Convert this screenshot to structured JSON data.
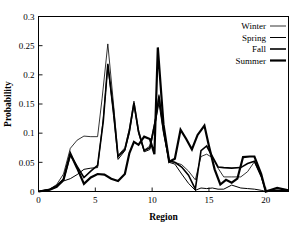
{
  "chart_data": {
    "type": "line",
    "title": "",
    "xlabel": "Region",
    "ylabel": "Probability",
    "xlim": [
      0,
      22
    ],
    "ylim": [
      0,
      0.3
    ],
    "grid": false,
    "legend_position": "top-right",
    "xticks": [
      "0",
      "5",
      "10",
      "15",
      "20"
    ],
    "xtick_values": [
      0,
      5,
      10,
      15,
      20
    ],
    "yticks": [
      "0",
      "0.05",
      "0.1",
      "0.15",
      "0.2",
      "0.25",
      "0.3"
    ],
    "ytick_values": [
      0,
      0.05,
      0.1,
      0.15,
      0.2,
      0.25,
      0.3
    ],
    "x": [
      0,
      1,
      2,
      3,
      4,
      5,
      6,
      7,
      8,
      9,
      10,
      11,
      12,
      13,
      14,
      15,
      16,
      17,
      18,
      19,
      20,
      21,
      22
    ],
    "series": [
      {
        "name": "Winter",
        "line_width": 0.8,
        "color": "#000000",
        "values": [
          0.0,
          0.005,
          0.021,
          0.074,
          0.095,
          0.094,
          0.253,
          0.112,
          0.155,
          0.088,
          0.166,
          0.081,
          0.052,
          0.049,
          0.064,
          0.06,
          0.025,
          0.025,
          0.025,
          0.051,
          0.0,
          0.0,
          0.0
        ]
      },
      {
        "name": "Spring",
        "line_width": 1.0,
        "color": "#000000",
        "values": [
          0.0,
          0.003,
          0.012,
          0.022,
          0.038,
          0.041,
          0.216,
          0.083,
          0.148,
          0.076,
          0.152,
          0.069,
          0.05,
          0.047,
          0.009,
          0.006,
          0.005,
          0.011,
          0.006,
          0.004,
          0.0,
          0.0,
          0.0
        ]
      },
      {
        "name": "Fall",
        "line_width": 1.6,
        "color": "#000000",
        "values": [
          0.0,
          0.004,
          0.018,
          0.063,
          0.024,
          0.045,
          0.219,
          0.071,
          0.152,
          0.081,
          0.163,
          0.073,
          0.056,
          0.053,
          0.07,
          0.078,
          0.041,
          0.041,
          0.041,
          0.052,
          0.001,
          0.002,
          0.001
        ]
      },
      {
        "name": "Summer",
        "line_width": 2.2,
        "color": "#000000",
        "values": [
          0.0,
          0.004,
          0.01,
          0.065,
          0.013,
          0.03,
          0.029,
          0.018,
          0.085,
          0.094,
          0.064,
          0.247,
          0.051,
          0.106,
          0.072,
          0.113,
          0.038,
          0.028,
          0.059,
          0.06,
          0.0,
          0.006,
          0.002
        ]
      }
    ],
    "series_detail_points": {
      "Winter": [
        [
          0,
          0.0
        ],
        [
          1,
          0.004
        ],
        [
          1.6,
          0.012
        ],
        [
          2.2,
          0.03
        ],
        [
          2.8,
          0.074
        ],
        [
          3.4,
          0.088
        ],
        [
          4.0,
          0.095
        ],
        [
          4.6,
          0.094
        ],
        [
          5.2,
          0.094
        ],
        [
          5.6,
          0.16
        ],
        [
          6.1,
          0.253
        ],
        [
          6.6,
          0.15
        ],
        [
          7.0,
          0.062
        ],
        [
          7.6,
          0.075
        ],
        [
          8.0,
          0.108
        ],
        [
          8.4,
          0.155
        ],
        [
          8.8,
          0.106
        ],
        [
          9.3,
          0.071
        ],
        [
          9.8,
          0.078
        ],
        [
          10.3,
          0.126
        ],
        [
          10.6,
          0.166
        ],
        [
          11.0,
          0.11
        ],
        [
          11.5,
          0.052
        ],
        [
          12.0,
          0.05
        ],
        [
          12.6,
          0.046
        ],
        [
          13.2,
          0.035
        ],
        [
          13.8,
          0.02
        ],
        [
          14.3,
          0.06
        ],
        [
          14.8,
          0.064
        ],
        [
          15.3,
          0.058
        ],
        [
          15.8,
          0.04
        ],
        [
          16.3,
          0.025
        ],
        [
          17.0,
          0.025
        ],
        [
          17.8,
          0.025
        ],
        [
          18.4,
          0.034
        ],
        [
          19.0,
          0.051
        ],
        [
          19.6,
          0.026
        ],
        [
          20.0,
          0.0
        ],
        [
          21,
          0.0
        ],
        [
          22,
          0.0
        ]
      ],
      "Spring": [
        [
          0,
          0.0
        ],
        [
          1,
          0.003
        ],
        [
          1.6,
          0.008
        ],
        [
          2.2,
          0.018
        ],
        [
          2.8,
          0.022
        ],
        [
          3.4,
          0.029
        ],
        [
          4.0,
          0.038
        ],
        [
          4.6,
          0.04
        ],
        [
          5.2,
          0.041
        ],
        [
          5.7,
          0.125
        ],
        [
          6.1,
          0.216
        ],
        [
          6.6,
          0.13
        ],
        [
          7.0,
          0.055
        ],
        [
          7.6,
          0.07
        ],
        [
          8.0,
          0.1
        ],
        [
          8.4,
          0.148
        ],
        [
          8.8,
          0.1
        ],
        [
          9.3,
          0.068
        ],
        [
          9.8,
          0.072
        ],
        [
          10.3,
          0.12
        ],
        [
          10.6,
          0.152
        ],
        [
          11.0,
          0.1
        ],
        [
          11.5,
          0.05
        ],
        [
          12.0,
          0.047
        ],
        [
          12.6,
          0.03
        ],
        [
          13.2,
          0.014
        ],
        [
          13.8,
          0.002
        ],
        [
          14.3,
          0.006
        ],
        [
          14.8,
          0.005
        ],
        [
          15.3,
          0.006
        ],
        [
          15.8,
          0.004
        ],
        [
          16.3,
          0.004
        ],
        [
          17.0,
          0.011
        ],
        [
          17.8,
          0.006
        ],
        [
          18.4,
          0.005
        ],
        [
          19.0,
          0.004
        ],
        [
          19.6,
          0.002
        ],
        [
          20.0,
          0.0
        ],
        [
          21,
          0.0
        ],
        [
          22,
          0.0
        ]
      ],
      "Fall": [
        [
          0,
          0.0
        ],
        [
          1,
          0.004
        ],
        [
          1.6,
          0.01
        ],
        [
          2.2,
          0.021
        ],
        [
          2.8,
          0.063
        ],
        [
          3.4,
          0.043
        ],
        [
          4.0,
          0.024
        ],
        [
          4.6,
          0.035
        ],
        [
          5.2,
          0.045
        ],
        [
          5.7,
          0.12
        ],
        [
          6.1,
          0.219
        ],
        [
          6.6,
          0.14
        ],
        [
          7.0,
          0.06
        ],
        [
          7.6,
          0.072
        ],
        [
          8.0,
          0.105
        ],
        [
          8.4,
          0.152
        ],
        [
          8.8,
          0.103
        ],
        [
          9.3,
          0.07
        ],
        [
          9.8,
          0.075
        ],
        [
          10.3,
          0.123
        ],
        [
          10.6,
          0.163
        ],
        [
          11.0,
          0.105
        ],
        [
          11.5,
          0.052
        ],
        [
          12.0,
          0.05
        ],
        [
          12.6,
          0.042
        ],
        [
          13.2,
          0.028
        ],
        [
          13.8,
          0.004
        ],
        [
          14.3,
          0.07
        ],
        [
          14.8,
          0.078
        ],
        [
          15.3,
          0.06
        ],
        [
          15.8,
          0.042
        ],
        [
          16.3,
          0.041
        ],
        [
          17.0,
          0.04
        ],
        [
          17.8,
          0.041
        ],
        [
          18.4,
          0.048
        ],
        [
          19.0,
          0.052
        ],
        [
          19.6,
          0.026
        ],
        [
          20.0,
          0.001
        ],
        [
          21,
          0.002
        ],
        [
          22,
          0.001
        ]
      ],
      "Summer": [
        [
          0,
          0.0
        ],
        [
          1,
          0.003
        ],
        [
          1.6,
          0.008
        ],
        [
          2.2,
          0.02
        ],
        [
          2.8,
          0.065
        ],
        [
          3.4,
          0.04
        ],
        [
          4.0,
          0.013
        ],
        [
          4.6,
          0.024
        ],
        [
          5.2,
          0.03
        ],
        [
          5.8,
          0.029
        ],
        [
          6.4,
          0.022
        ],
        [
          7.0,
          0.018
        ],
        [
          7.6,
          0.03
        ],
        [
          8.0,
          0.066
        ],
        [
          8.4,
          0.085
        ],
        [
          8.8,
          0.08
        ],
        [
          9.3,
          0.094
        ],
        [
          9.8,
          0.09
        ],
        [
          10.2,
          0.064
        ],
        [
          10.5,
          0.247
        ],
        [
          11.0,
          0.115
        ],
        [
          11.5,
          0.051
        ],
        [
          12.0,
          0.056
        ],
        [
          12.5,
          0.106
        ],
        [
          13.0,
          0.09
        ],
        [
          13.5,
          0.072
        ],
        [
          14.0,
          0.097
        ],
        [
          14.6,
          0.113
        ],
        [
          15.0,
          0.078
        ],
        [
          15.5,
          0.038
        ],
        [
          16.0,
          0.012
        ],
        [
          16.5,
          0.02
        ],
        [
          17.0,
          0.015
        ],
        [
          17.5,
          0.022
        ],
        [
          18.0,
          0.059
        ],
        [
          18.6,
          0.06
        ],
        [
          19.0,
          0.06
        ],
        [
          19.6,
          0.03
        ],
        [
          20.0,
          0.0
        ],
        [
          21,
          0.006
        ],
        [
          22,
          0.002
        ]
      ]
    }
  },
  "legend": {
    "items": [
      {
        "label": "Winter",
        "width_key": 0
      },
      {
        "label": "Spring",
        "width_key": 1
      },
      {
        "label": "Fall",
        "width_key": 2
      },
      {
        "label": "Summer",
        "width_key": 3
      }
    ]
  }
}
